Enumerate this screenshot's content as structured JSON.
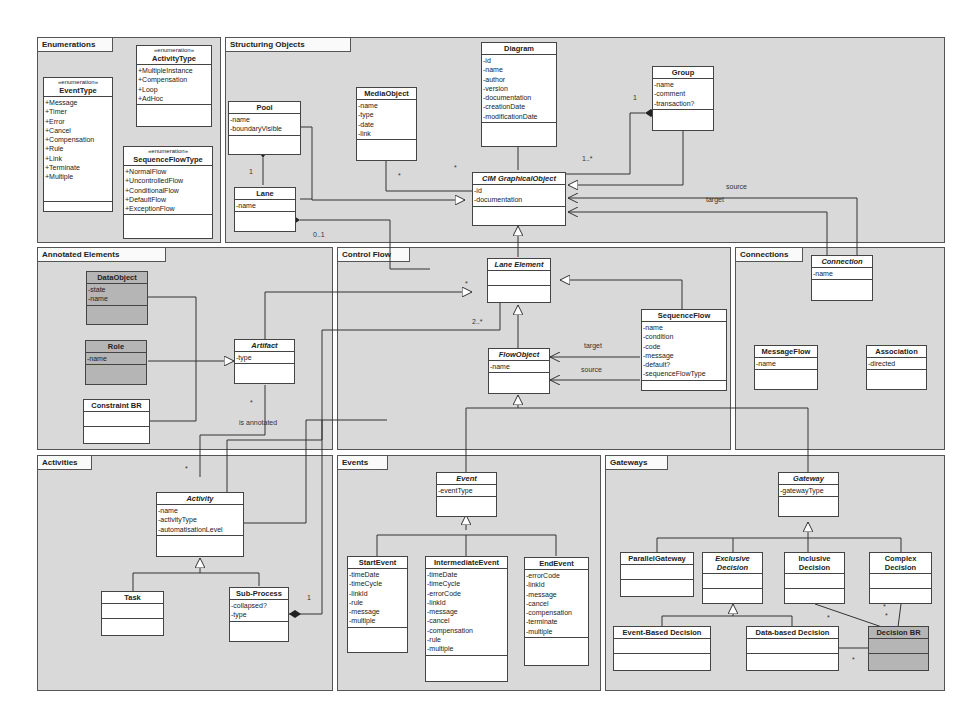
{
  "packages": {
    "enumerations": "Enumerations",
    "structuring": "Structuring Objects",
    "annotated": "Annotated Elements",
    "control_flow": "Control Flow",
    "connections": "Connections",
    "activities": "Activities",
    "events": "Events",
    "gateways": "Gateways"
  },
  "stereotype": "«enumeration»",
  "classes": {
    "event_type": {
      "name": "EventType",
      "attrs": [
        "+Message",
        "+Timer",
        "+Error",
        "+Cancel",
        "+Compensation",
        "+Rule",
        "+Link",
        "+Terminate",
        "+Multiple"
      ]
    },
    "activity_type": {
      "name": "ActivityType",
      "attrs": [
        "+MultipleInstance",
        "+Compensation",
        "+Loop",
        "+AdHoc"
      ]
    },
    "sequence_flow_type": {
      "name": "SequenceFlowType",
      "attrs": [
        "+NormalFlow",
        "+UncontrolledFlow",
        "+ConditionalFlow",
        "+DefaultFlow",
        "+ExceptionFlow"
      ]
    },
    "pool": {
      "name": "Pool",
      "attrs": [
        "-name",
        "-boundaryVisible"
      ]
    },
    "lane": {
      "name": "Lane",
      "attrs": [
        "-name"
      ]
    },
    "media_object": {
      "name": "MediaObject",
      "attrs": [
        "-name",
        "-type",
        "-date",
        "-link"
      ]
    },
    "diagram": {
      "name": "Diagram",
      "attrs": [
        "-id",
        "-name",
        "-author",
        "-version",
        "-documentation",
        "-creationDate",
        "-modificationDate"
      ]
    },
    "group": {
      "name": "Group",
      "attrs": [
        "-name",
        "-comment",
        "-transaction?"
      ]
    },
    "cim_graphical_object": {
      "name": "CIM GraphicalObject",
      "attrs": [
        "-id",
        "-documentation"
      ]
    },
    "data_object": {
      "name": "DataObject",
      "attrs": [
        "-state",
        "-name"
      ]
    },
    "role": {
      "name": "Role",
      "attrs": [
        "-name"
      ]
    },
    "constraint_br": {
      "name": "Constraint BR",
      "attrs": []
    },
    "artifact": {
      "name": "Artifact",
      "attrs": [
        "-type"
      ]
    },
    "lane_element": {
      "name": "Lane Element",
      "attrs": []
    },
    "flow_object": {
      "name": "FlowObject",
      "attrs": [
        "-name"
      ]
    },
    "sequence_flow": {
      "name": "SequenceFlow",
      "attrs": [
        "-name",
        "-condition",
        "-code",
        "-message",
        "-default?",
        "-sequenceFlowType"
      ]
    },
    "connection": {
      "name": "Connection",
      "attrs": [
        "-name"
      ]
    },
    "message_flow": {
      "name": "MessageFlow",
      "attrs": [
        "-name"
      ]
    },
    "association": {
      "name": "Association",
      "attrs": [
        "-directed"
      ]
    },
    "activity": {
      "name": "Activity",
      "attrs": [
        "-name",
        "-activityType",
        "-automatisationLevel"
      ]
    },
    "task": {
      "name": "Task",
      "attrs": []
    },
    "sub_process": {
      "name": "Sub-Process",
      "attrs": [
        "-collapsed?",
        "-type"
      ]
    },
    "event": {
      "name": "Event",
      "attrs": [
        "-eventType"
      ]
    },
    "start_event": {
      "name": "StartEvent",
      "attrs": [
        "-timeDate",
        "-timeCycle",
        "-linkId",
        "-rule",
        "-message",
        "-multiple"
      ]
    },
    "intermediate_event": {
      "name": "IntermediateEvent",
      "attrs": [
        "-timeDate",
        "-timeCycle",
        "-errorCode",
        "-linkId",
        "-message",
        "-cancel",
        "-compensation",
        "-rule",
        "-multiple"
      ]
    },
    "end_event": {
      "name": "EndEvent",
      "attrs": [
        "-errorCode",
        "-linkId",
        "-message",
        "-cancel",
        "-compensation",
        "-terminate",
        "-multiple"
      ]
    },
    "gateway": {
      "name": "Gateway",
      "attrs": [
        "-gatewayType"
      ]
    },
    "parallel_gateway": {
      "name": "ParallelGateway",
      "attrs": []
    },
    "exclusive_decision": {
      "name": "Exclusive Decision",
      "attrs": []
    },
    "inclusive_decision": {
      "name": "Inclusive Decision",
      "attrs": []
    },
    "complex_decision": {
      "name": "Complex Decision",
      "attrs": []
    },
    "event_based_decision": {
      "name": "Event-Based Decision",
      "attrs": []
    },
    "data_based_decision": {
      "name": "Data-based Decision",
      "attrs": []
    },
    "decision_br": {
      "name": "Decision BR",
      "attrs": []
    }
  },
  "labels": {
    "pool_lane_mult": "1",
    "lane_mult": "0..1",
    "media_mult": "*",
    "media_mult2": "*",
    "group_mult": "1",
    "group_cim_mult": "1..*",
    "source": "source",
    "target": "target",
    "lane_elem_mult": "*",
    "two_star": "2..*",
    "flow_target": "target",
    "flow_source": "source",
    "artifact_mult": "*",
    "is_annotated": "is annotated",
    "activity_mult": "*",
    "subprocess_mult": "1",
    "dbr_mult1": "*",
    "dbr_mult2": "*",
    "dbr_mult3": "*",
    "dbr_mult4": "*"
  }
}
